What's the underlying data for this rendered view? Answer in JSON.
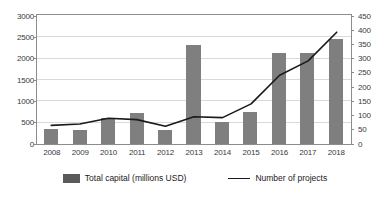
{
  "chart_data": {
    "type": "bar",
    "title": "",
    "subtitle": "",
    "xlabel": "",
    "ylabel": "",
    "y2label": "",
    "grid": true,
    "legend_position": "bottom",
    "categories": [
      "2008",
      "2009",
      "2010",
      "2011",
      "2012",
      "2013",
      "2014",
      "2015",
      "2016",
      "2017",
      "2018"
    ],
    "ylim": [
      0,
      3000
    ],
    "yticks": [
      0,
      500,
      1000,
      1500,
      2000,
      2500,
      3000
    ],
    "ytick_labels": [
      "0",
      "500",
      "1000",
      "1500",
      "2000",
      "2500",
      "3000"
    ],
    "y2lim": [
      0,
      450
    ],
    "y2ticks": [
      0,
      50,
      100,
      150,
      200,
      250,
      300,
      350,
      400,
      450
    ],
    "y2tick_labels": [
      "0",
      "50",
      "100",
      "150",
      "200",
      "250",
      "300",
      "350",
      "400",
      "450"
    ],
    "series": [
      {
        "name": "Total capital (millions USD)",
        "type": "bar",
        "axis": "left",
        "color": "#7f7f7f",
        "values": [
          350,
          340,
          600,
          720,
          340,
          2325,
          520,
          760,
          2130,
          2140,
          2460
        ]
      },
      {
        "name": "Number of projects",
        "type": "line",
        "axis": "right",
        "color": "#1a1a1a",
        "values": [
          65,
          70,
          90,
          85,
          62,
          95,
          92,
          140,
          240,
          290,
          390
        ]
      }
    ]
  },
  "legend": {
    "items": [
      {
        "label": "Total capital (millions USD)",
        "marker": "bar-swatch-icon",
        "color": "#5a5a5a"
      },
      {
        "label": "Number of projects",
        "marker": "line-swatch-icon",
        "color": "#1a1a1a"
      }
    ]
  },
  "colors": {
    "bar": "#7f7f7f",
    "line": "#1a1a1a",
    "grid": "#d9d9d9",
    "axis": "#8c8c8c",
    "text": "#3a3a3a",
    "background": "#ffffff"
  }
}
